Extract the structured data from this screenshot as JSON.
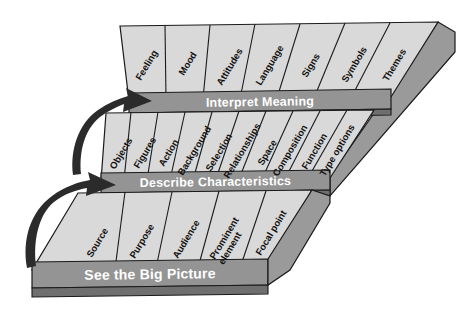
{
  "diagram": {
    "type": "layered-3d-block-diagram",
    "colors": {
      "slab_top": "#d9d9d9",
      "slab_side": "#9a9a9a",
      "band_fill": "#949494",
      "band_edge": "#6f6f6f",
      "outline": "#1a1a1a",
      "label_text": "#111111",
      "band_text": "#ffffff",
      "arrow": "#2b2b2b",
      "background": "#ffffff"
    },
    "layers": [
      {
        "id": "layer-top",
        "band_label": "Interpret Meaning",
        "cells": [
          "Feeling",
          "Mood",
          "Attitudes",
          "Language",
          "Signs",
          "Symbols",
          "Themes"
        ]
      },
      {
        "id": "layer-middle",
        "band_label": "Describe Characteristics",
        "cells": [
          "Objects",
          "Figures",
          "Action",
          "Background",
          "Selection",
          "Relationships",
          "Space",
          "Composition",
          "Function",
          "Type options"
        ]
      },
      {
        "id": "layer-bottom",
        "band_label": "See the Big Picture",
        "cells": [
          "Source",
          "Purpose",
          "Audience",
          "Prominent element",
          "Focal point"
        ]
      }
    ],
    "arrows": [
      {
        "id": "arrow-lower",
        "name": "curved-arrow-icon",
        "direction": "up-right"
      },
      {
        "id": "arrow-upper",
        "name": "curved-arrow-icon",
        "direction": "up-right"
      }
    ]
  }
}
